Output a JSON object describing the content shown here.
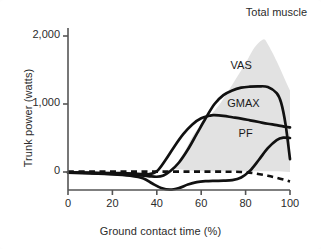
{
  "figure": {
    "background": "#ffffff",
    "title": "Total muscle"
  },
  "chart_data": {
    "type": "line",
    "title": "Total muscle",
    "xlabel": "Ground contact time (%)",
    "ylabel": "Trunk power (watts)",
    "xlim": [
      0,
      100
    ],
    "ylim": [
      -400,
      2100
    ],
    "grid": false,
    "legend_position": "inline-annotations",
    "xticks": [
      0,
      20,
      40,
      60,
      80,
      100
    ],
    "xtick_labels": [
      "0",
      "20",
      "40",
      "60",
      "80",
      "100"
    ],
    "yticks": [
      0,
      1000,
      2000
    ],
    "ytick_labels": [
      "0",
      "1,000",
      "2,000"
    ],
    "annotations": [
      {
        "text": "Total muscle",
        "x": 88,
        "y": 2050
      },
      {
        "text": "VAS",
        "x": 78,
        "y": 1560
      },
      {
        "text": "GMAX",
        "x": 79,
        "y": 1000
      },
      {
        "text": "PF",
        "x": 80,
        "y": 560
      }
    ],
    "band": {
      "name": "Total muscle",
      "color": "#e2e2e2",
      "x": [
        47,
        50,
        53,
        56,
        60,
        64,
        68,
        72,
        76,
        80,
        84,
        88,
        90,
        92,
        95,
        98,
        100
      ],
      "upper": [
        40,
        160,
        330,
        520,
        700,
        830,
        980,
        1180,
        1390,
        1600,
        1830,
        1950,
        1880,
        1760,
        1560,
        1340,
        1200
      ],
      "lower": [
        40,
        40,
        30,
        20,
        10,
        10,
        10,
        10,
        10,
        10,
        10,
        10,
        10,
        10,
        10,
        5,
        0
      ]
    },
    "series": [
      {
        "name": "VAS",
        "style": "solid",
        "color": "#111111",
        "x": [
          0,
          10,
          20,
          30,
          36,
          40,
          43,
          46,
          50,
          54,
          58,
          62,
          66,
          70,
          74,
          78,
          82,
          86,
          90,
          94,
          96,
          98,
          100
        ],
        "y": [
          -10,
          -20,
          -30,
          -45,
          -60,
          -70,
          -50,
          10,
          140,
          330,
          560,
          790,
          1000,
          1130,
          1200,
          1240,
          1255,
          1260,
          1250,
          1160,
          1020,
          700,
          190
        ]
      },
      {
        "name": "GMAX",
        "style": "solid",
        "color": "#111111",
        "x": [
          0,
          10,
          20,
          30,
          36,
          40,
          44,
          48,
          52,
          56,
          60,
          64,
          66,
          70,
          74,
          78,
          82,
          86,
          90,
          94,
          98,
          100
        ],
        "y": [
          -5,
          -10,
          -15,
          -25,
          -35,
          10,
          180,
          380,
          560,
          700,
          790,
          830,
          835,
          825,
          805,
          785,
          760,
          735,
          710,
          690,
          665,
          655
        ]
      },
      {
        "name": "PF",
        "style": "solid",
        "color": "#111111",
        "x": [
          0,
          10,
          20,
          28,
          34,
          38,
          42,
          46,
          50,
          54,
          58,
          62,
          66,
          70,
          74,
          78,
          82,
          86,
          90,
          94,
          97,
          100
        ],
        "y": [
          -5,
          -15,
          -30,
          -55,
          -95,
          -170,
          -235,
          -260,
          -235,
          -185,
          -150,
          -135,
          -130,
          -128,
          -120,
          -80,
          20,
          180,
          350,
          470,
          505,
          500
        ]
      },
      {
        "name": "zero-reference",
        "style": "dashed",
        "color": "#111111",
        "x": [
          0,
          10,
          20,
          30,
          40,
          50,
          60,
          70,
          78,
          84,
          90,
          94,
          98,
          100
        ],
        "y": [
          5,
          5,
          5,
          5,
          5,
          5,
          5,
          5,
          0,
          -20,
          -55,
          -85,
          -120,
          -140
        ]
      }
    ]
  }
}
